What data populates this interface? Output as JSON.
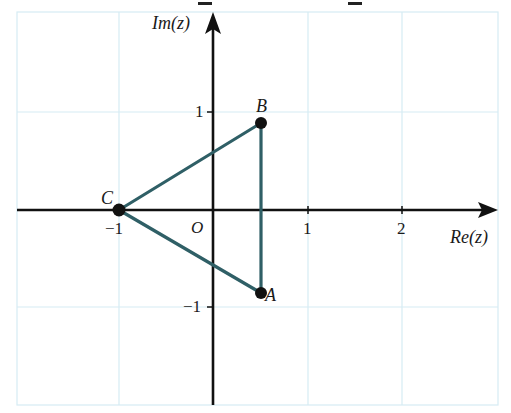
{
  "diagram": {
    "type": "complex-plane-triangle",
    "axes": {
      "x_label": "Re(z)",
      "y_label": "Im(z)",
      "origin_label": "O",
      "x_ticks": [
        "−1",
        "1",
        "2"
      ],
      "y_ticks": [
        "1",
        "−1"
      ],
      "x_range": [
        -2,
        3
      ],
      "y_range": [
        -2,
        2
      ]
    },
    "points": [
      {
        "name": "A",
        "label": "A",
        "re": 0.5,
        "im": -0.866
      },
      {
        "name": "B",
        "label": "B",
        "re": 0.5,
        "im": 0.866
      },
      {
        "name": "C",
        "label": "C",
        "re": -1,
        "im": 0
      }
    ],
    "edges": [
      [
        "C",
        "B"
      ],
      [
        "B",
        "A"
      ],
      [
        "A",
        "C"
      ]
    ],
    "colors": {
      "grid": "#d6ecf3",
      "axes": "#111111",
      "triangle": "#2f5f66",
      "points": "#111111",
      "text": "#1a1a1a"
    }
  }
}
